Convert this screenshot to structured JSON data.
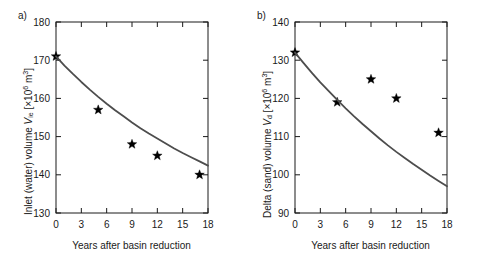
{
  "figure": {
    "background": "#ffffff",
    "curve_color": "#4d4d4d",
    "marker_color": "#000000",
    "axis_color": "#1a1a1a"
  },
  "panels": [
    {
      "key": "a",
      "label": "a)",
      "xlabel": "Years after basin reduction",
      "ylabel_prefix": "Inlet (water) volume ",
      "ylabel_symbol": "V",
      "ylabel_subscript": "ie",
      "ylabel_units_open": " [×10",
      "ylabel_units_exp": "6",
      "ylabel_units_close": " m",
      "ylabel_units_exp2": "3",
      "ylabel_units_end": "]",
      "xticks": [
        "0",
        "3",
        "6",
        "9",
        "12",
        "15",
        "18"
      ],
      "yticks": [
        "130",
        "140",
        "150",
        "160",
        "170",
        "180"
      ]
    },
    {
      "key": "b",
      "label": "b)",
      "xlabel": "Years after basin reduction",
      "ylabel_prefix": "Delta (sand) volume ",
      "ylabel_symbol": "V",
      "ylabel_subscript": "d",
      "ylabel_units_open": " [×10",
      "ylabel_units_exp": "6",
      "ylabel_units_close": " m",
      "ylabel_units_exp2": "3",
      "ylabel_units_end": "]",
      "xticks": [
        "0",
        "3",
        "6",
        "9",
        "12",
        "15",
        "18"
      ],
      "yticks": [
        "90",
        "100",
        "110",
        "120",
        "130",
        "140"
      ]
    }
  ],
  "chart_data": [
    {
      "type": "scatter",
      "panel": "a",
      "title": "a)",
      "xlabel": "Years after basin reduction",
      "ylabel": "Inlet (water) volume V_ie [×10^6 m^3]",
      "xlim": [
        0,
        18
      ],
      "ylim": [
        130,
        180
      ],
      "xticks": [
        0,
        3,
        6,
        9,
        12,
        15,
        18
      ],
      "yticks": [
        130,
        140,
        150,
        160,
        170,
        180
      ],
      "grid": false,
      "legend": null,
      "series": [
        {
          "name": "measurements",
          "marker": "star",
          "x": [
            0,
            5,
            9,
            12,
            17
          ],
          "y": [
            171,
            157,
            148,
            145,
            140
          ]
        },
        {
          "name": "fitted exponential curve",
          "marker": "line",
          "x": [
            0,
            1,
            2,
            3,
            4,
            5,
            6,
            7,
            8,
            9,
            10,
            11,
            12,
            13,
            14,
            15,
            16,
            17,
            18
          ],
          "y": [
            171.0,
            168.6,
            166.4,
            164.3,
            162.3,
            160.4,
            158.6,
            156.9,
            155.3,
            153.7,
            152.2,
            150.8,
            149.5,
            148.2,
            146.9,
            145.7,
            144.6,
            143.5,
            142.4
          ]
        }
      ]
    },
    {
      "type": "scatter",
      "panel": "b",
      "title": "b)",
      "xlabel": "Years after basin reduction",
      "ylabel": "Delta (sand) volume V_d [×10^6 m^3]",
      "xlim": [
        0,
        18
      ],
      "ylim": [
        90,
        140
      ],
      "xticks": [
        0,
        3,
        6,
        9,
        12,
        15,
        18
      ],
      "yticks": [
        90,
        100,
        110,
        120,
        130,
        140
      ],
      "grid": false,
      "legend": null,
      "series": [
        {
          "name": "measurements",
          "marker": "star",
          "x": [
            0,
            5,
            9,
            12,
            17
          ],
          "y": [
            132,
            119,
            125,
            120,
            111
          ]
        },
        {
          "name": "fitted exponential curve",
          "marker": "line",
          "x": [
            0,
            1,
            2,
            3,
            4,
            5,
            6,
            7,
            8,
            9,
            10,
            11,
            12,
            13,
            14,
            15,
            16,
            17,
            18
          ],
          "y": [
            132.0,
            129.3,
            126.7,
            124.2,
            121.9,
            119.6,
            117.4,
            115.3,
            113.3,
            111.4,
            109.5,
            107.7,
            106.0,
            104.4,
            102.8,
            101.3,
            99.8,
            98.4,
            97.0
          ]
        }
      ]
    }
  ]
}
